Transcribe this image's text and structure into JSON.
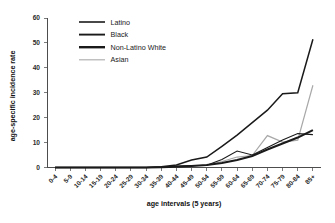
{
  "chart_data": {
    "type": "line",
    "title": "",
    "xlabel": "age intervals (5 years)",
    "ylabel": "age-specific incidence rate",
    "grid": false,
    "legend_position": "upper-left-inside",
    "ylim": [
      0,
      60
    ],
    "yticks": [
      0,
      10,
      20,
      30,
      40,
      50,
      60
    ],
    "ytick_labels": [
      "0",
      "10",
      "20",
      "30",
      "40",
      "50",
      "60"
    ],
    "categories": [
      "0-4",
      "5-9",
      "10-14",
      "15-19",
      "20-24",
      "25-29",
      "30-34",
      "35-39",
      "40-44",
      "45-49",
      "50-54",
      "55-59",
      "60-64",
      "65-69",
      "70-74",
      "75-79",
      "80-84",
      "85+"
    ],
    "series": [
      {
        "name": "Latino",
        "color": "#1a1a1a",
        "stroke_width": 1.5,
        "values": [
          0,
          0,
          0,
          0,
          0,
          0,
          0,
          0.3,
          1.0,
          3.0,
          4.2,
          8.5,
          13.0,
          18.0,
          23.0,
          29.6,
          30.0,
          51.5
        ]
      },
      {
        "name": "Black",
        "color": "#1a1a1a",
        "stroke_width": 1.1,
        "values": [
          0,
          0,
          0,
          0,
          0,
          0,
          0,
          0.2,
          0.6,
          0.8,
          0.9,
          3.2,
          6.6,
          5.0,
          8.0,
          11.0,
          13.6,
          13.2
        ]
      },
      {
        "name": "Non-Latino White",
        "color": "#1a1a1a",
        "stroke_width": 2.1,
        "values": [
          0,
          0,
          0,
          0,
          0,
          0,
          0,
          0.1,
          0.3,
          0.6,
          1.0,
          1.8,
          3.0,
          4.6,
          7.2,
          9.6,
          12.0,
          15.0
        ]
      },
      {
        "name": "Asian",
        "color": "#a8a8a8",
        "stroke_width": 1.2,
        "values": [
          0,
          0,
          0,
          0,
          0,
          0,
          0,
          0.1,
          0.3,
          0.7,
          0.9,
          2.4,
          4.2,
          4.8,
          12.8,
          10.2,
          11.0,
          33.0
        ]
      }
    ]
  },
  "axes": {
    "y_title": "age-specific incidence rate",
    "x_title": "age intervals (5 years)"
  },
  "legend": {
    "entries": [
      {
        "label": "Latino",
        "color": "#1a1a1a",
        "stroke_width": 1.6
      },
      {
        "label": "Black",
        "color": "#1a1a1a",
        "stroke_width": 1.9
      },
      {
        "label": "Non-Latino White",
        "color": "#1a1a1a",
        "stroke_width": 2.4
      },
      {
        "label": "Asian",
        "color": "#b0b0b0",
        "stroke_width": 1.2
      }
    ]
  }
}
